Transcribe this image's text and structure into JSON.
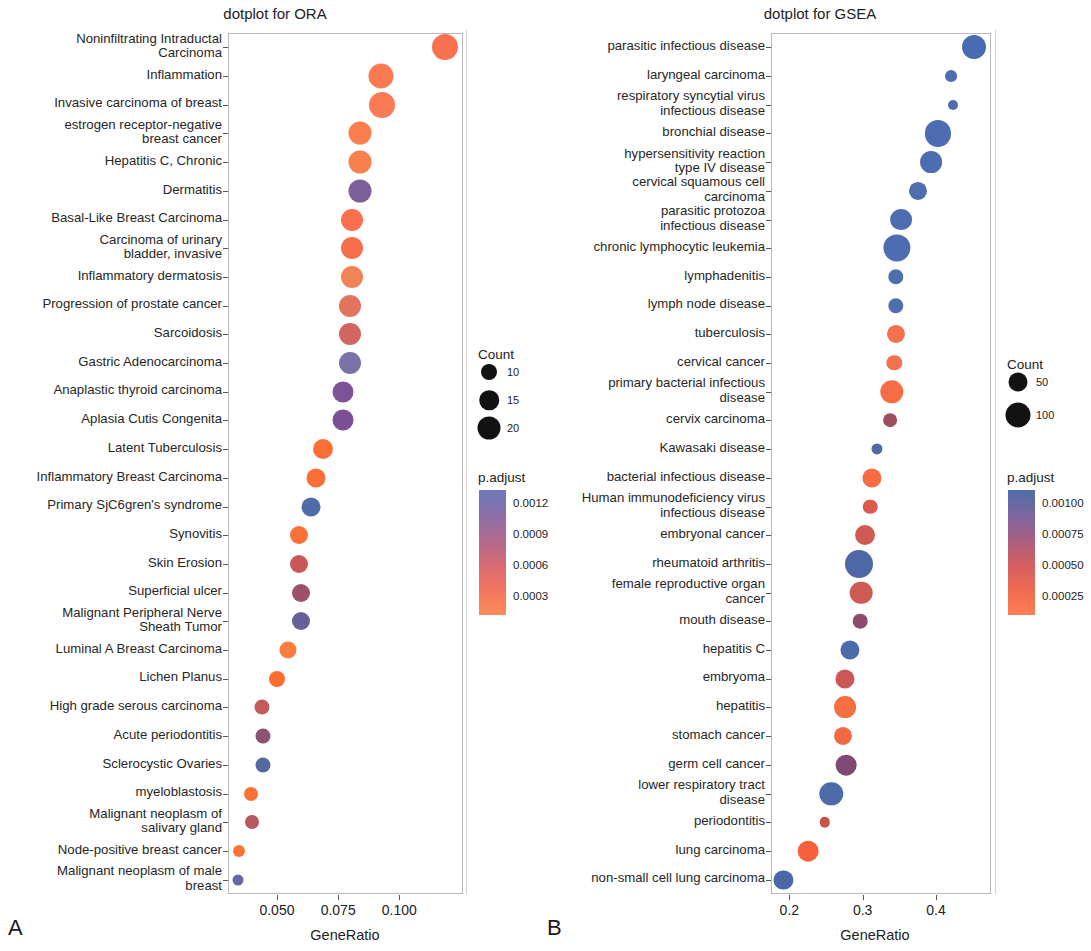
{
  "figure": {
    "panelA_letter": "A",
    "panelB_letter": "B"
  },
  "chart_data": [
    {
      "type": "scatter",
      "id": "ora",
      "title": "dotplot for ORA",
      "xlabel": "GeneRatio",
      "ylabel": "",
      "xlim": [
        0.03,
        0.126
      ],
      "xticks": [
        0.05,
        0.075,
        0.1
      ],
      "xtick_labels": [
        "0.050",
        "0.075",
        "0.100"
      ],
      "grid": false,
      "legend_position": "right",
      "size_legend": {
        "title": "Count",
        "values": [
          10,
          15,
          20
        ],
        "labels": [
          "10",
          "15",
          "20"
        ]
      },
      "color_legend": {
        "title": "p.adjust",
        "ticks": [
          0.0012,
          0.0009,
          0.0006,
          0.0003
        ],
        "tick_labels": [
          "0.0012",
          "0.0009",
          "0.0006",
          "0.0003"
        ],
        "low_color": "#f8766d",
        "high_color": "#5c6bb0",
        "gradient": [
          "#6b79b8",
          "#8c6fa8",
          "#b06a8e",
          "#d76b72",
          "#f4755f",
          "#fb8c5a"
        ]
      },
      "categories": [
        "Noninfiltrating Intraductal\nCarcinoma",
        "Inflammation",
        "Invasive carcinoma of breast",
        "estrogen receptor-negative\nbreast cancer",
        "Hepatitis C, Chronic",
        "Dermatitis",
        "Basal-Like Breast Carcinoma",
        "Carcinoma of urinary\nbladder, invasive",
        "Inflammatory dermatosis",
        "Progression of prostate cancer",
        "Sarcoidosis",
        "Gastric Adenocarcinoma",
        "Anaplastic thyroid carcinoma",
        "Aplasia Cutis Congenita",
        "Latent Tuberculosis",
        "Inflammatory Breast Carcinoma",
        "Primary SjC6gren's syndrome",
        "Synovitis",
        "Skin Erosion",
        "Superficial ulcer",
        "Malignant Peripheral Nerve\nSheath Tumor",
        "Luminal A Breast Carcinoma",
        "Lichen Planus",
        "High grade serous carcinoma",
        "Acute periodontitis",
        "Sclerocystic Ovaries",
        "myeloblastosis",
        "Malignant neoplasm of\nsalivary gland",
        "Node-positive breast cancer",
        "Malignant neoplasm of male\nbreast"
      ],
      "points": [
        {
          "y": "Noninfiltrating Intraductal Carcinoma",
          "x": 0.1185,
          "count": 19,
          "p_adjust": 0.0002,
          "color": "#f8714f"
        },
        {
          "y": "Inflammation",
          "x": 0.0925,
          "count": 18,
          "p_adjust": 0.00022,
          "color": "#fa7a53"
        },
        {
          "y": "Invasive carcinoma of breast",
          "x": 0.093,
          "count": 19,
          "p_adjust": 0.00024,
          "color": "#f97a54"
        },
        {
          "y": "estrogen receptor-negative breast cancer",
          "x": 0.084,
          "count": 16,
          "p_adjust": 0.00022,
          "color": "#fb7e4e"
        },
        {
          "y": "Hepatitis C, Chronic",
          "x": 0.084,
          "count": 16,
          "p_adjust": 0.00026,
          "color": "#f6814f"
        },
        {
          "y": "Dermatitis",
          "x": 0.084,
          "count": 16,
          "p_adjust": 0.001,
          "color": "#7c5f9a"
        },
        {
          "y": "Basal-Like Breast Carcinoma",
          "x": 0.0805,
          "count": 15,
          "p_adjust": 0.00022,
          "color": "#fa6f4c"
        },
        {
          "y": "Carcinoma of urinary bladder, invasive",
          "x": 0.0805,
          "count": 15,
          "p_adjust": 0.00023,
          "color": "#f86e4c"
        },
        {
          "y": "Inflammatory dermatosis",
          "x": 0.0805,
          "count": 15,
          "p_adjust": 0.0003,
          "color": "#f08457"
        },
        {
          "y": "Progression of prostate cancer",
          "x": 0.08,
          "count": 15,
          "p_adjust": 0.00038,
          "color": "#e2735d"
        },
        {
          "y": "Sarcoidosis",
          "x": 0.08,
          "count": 15,
          "p_adjust": 0.00048,
          "color": "#d26660"
        },
        {
          "y": "Gastric Adenocarcinoma",
          "x": 0.08,
          "count": 15,
          "p_adjust": 0.00105,
          "color": "#7b72a8"
        },
        {
          "y": "Anaplastic thyroid carcinoma",
          "x": 0.077,
          "count": 14,
          "p_adjust": 0.00098,
          "color": "#7e529b"
        },
        {
          "y": "Aplasia Cutis Congenita",
          "x": 0.077,
          "count": 14,
          "p_adjust": 0.00097,
          "color": "#7a4f96"
        },
        {
          "y": "Latent Tuberculosis",
          "x": 0.069,
          "count": 13,
          "p_adjust": 0.00018,
          "color": "#fc6e35"
        },
        {
          "y": "Inflammatory Breast Carcinoma",
          "x": 0.066,
          "count": 12,
          "p_adjust": 0.00019,
          "color": "#fb6e36"
        },
        {
          "y": "Primary SjC6gren's syndrome",
          "x": 0.064,
          "count": 12,
          "p_adjust": 0.00116,
          "color": "#4f6ca8"
        },
        {
          "y": "Synovitis",
          "x": 0.059,
          "count": 11,
          "p_adjust": 0.0002,
          "color": "#fb7034"
        },
        {
          "y": "Skin Erosion",
          "x": 0.059,
          "count": 11,
          "p_adjust": 0.00047,
          "color": "#c95757"
        },
        {
          "y": "Superficial ulcer",
          "x": 0.06,
          "count": 11,
          "p_adjust": 0.00059,
          "color": "#9c5069"
        },
        {
          "y": "Malignant Peripheral Nerve Sheath Tumor",
          "x": 0.06,
          "count": 11,
          "p_adjust": 0.00112,
          "color": "#65609c"
        },
        {
          "y": "Luminal A Breast Carcinoma",
          "x": 0.0545,
          "count": 10,
          "p_adjust": 0.0002,
          "color": "#fb7c3c"
        },
        {
          "y": "Lichen Planus",
          "x": 0.05,
          "count": 9,
          "p_adjust": 0.00018,
          "color": "#fc6e2f"
        },
        {
          "y": "High grade serous carcinoma",
          "x": 0.044,
          "count": 8,
          "p_adjust": 0.00046,
          "color": "#c35a5c"
        },
        {
          "y": "Acute periodontitis",
          "x": 0.0445,
          "count": 8,
          "p_adjust": 0.00065,
          "color": "#8f5170"
        },
        {
          "y": "Sclerocystic Ovaries",
          "x": 0.0445,
          "count": 8,
          "p_adjust": 0.00114,
          "color": "#53699f"
        },
        {
          "y": "myeloblastosis",
          "x": 0.0395,
          "count": 7,
          "p_adjust": 0.00019,
          "color": "#fb7235"
        },
        {
          "y": "Malignant neoplasm of salivary gland",
          "x": 0.04,
          "count": 7,
          "p_adjust": 0.00049,
          "color": "#b7575f"
        },
        {
          "y": "Node-positive breast cancer",
          "x": 0.0345,
          "count": 5,
          "p_adjust": 0.0002,
          "color": "#fb7338"
        },
        {
          "y": "Malignant neoplasm of male breast",
          "x": 0.034,
          "count": 4,
          "p_adjust": 0.00115,
          "color": "#6566a6"
        }
      ]
    },
    {
      "type": "scatter",
      "id": "gsea",
      "title": "dotplot for GSEA",
      "xlabel": "GeneRatio",
      "ylabel": "",
      "xlim": [
        0.175,
        0.475
      ],
      "xticks": [
        0.2,
        0.3,
        0.4
      ],
      "xtick_labels": [
        "0.2",
        "0.3",
        "0.4"
      ],
      "grid": false,
      "legend_position": "right",
      "size_legend": {
        "title": "Count",
        "values": [
          50,
          100
        ],
        "labels": [
          "50",
          "100"
        ]
      },
      "color_legend": {
        "title": "p.adjust",
        "ticks": [
          0.001,
          0.00075,
          0.0005,
          0.00025
        ],
        "tick_labels": [
          "0.00100",
          "0.00075",
          "0.00050",
          "0.00025"
        ],
        "low_color": "#f8766d",
        "high_color": "#5c6bb0",
        "gradient": [
          "#4f6ca8",
          "#7b66a0",
          "#a95f80",
          "#d45f62",
          "#ef6a51",
          "#fb7f55"
        ]
      },
      "categories": [
        "parasitic infectious disease",
        "laryngeal carcinoma",
        "respiratory syncytial virus\ninfectious disease",
        "bronchial disease",
        "hypersensitivity reaction\ntype IV disease",
        "cervical squamous cell\ncarcinoma",
        "parasitic protozoa\ninfectious disease",
        "chronic lymphocytic leukemia",
        "lymphadenitis",
        "lymph node disease",
        "tuberculosis",
        "cervical cancer",
        "primary bacterial infectious\ndisease",
        "cervix carcinoma",
        "Kawasaki disease",
        "bacterial infectious disease",
        "Human immunodeficiency virus\ninfectious disease",
        "embryonal cancer",
        "rheumatoid arthritis",
        "female reproductive organ\ncancer",
        "mouth disease",
        "hepatitis C",
        "embryoma",
        "hepatitis",
        "stomach cancer",
        "germ cell cancer",
        "lower respiratory tract\ndisease",
        "periodontitis",
        "lung carcinoma",
        "non-small cell lung carcinoma"
      ],
      "points": [
        {
          "y": "parasitic infectious disease",
          "x": 0.452,
          "count": 80,
          "p_adjust": 0.00104,
          "color": "#4a6bb2"
        },
        {
          "y": "laryngeal carcinoma",
          "x": 0.42,
          "count": 35,
          "p_adjust": 0.00102,
          "color": "#4f6eb0"
        },
        {
          "y": "respiratory syncytial virus infectious disease",
          "x": 0.423,
          "count": 28,
          "p_adjust": 0.00102,
          "color": "#4f6eb0"
        },
        {
          "y": "bronchial disease",
          "x": 0.403,
          "count": 88,
          "p_adjust": 0.00103,
          "color": "#4d6cb1"
        },
        {
          "y": "hypersensitivity reaction type IV disease",
          "x": 0.393,
          "count": 72,
          "p_adjust": 0.00103,
          "color": "#4d6cb1"
        },
        {
          "y": "cervical squamous cell carcinoma",
          "x": 0.375,
          "count": 58,
          "p_adjust": 0.00102,
          "color": "#4f6eb0"
        },
        {
          "y": "parasitic protozoa infectious disease",
          "x": 0.352,
          "count": 72,
          "p_adjust": 0.00103,
          "color": "#4d6cb1"
        },
        {
          "y": "chronic lymphocytic leukemia",
          "x": 0.347,
          "count": 92,
          "p_adjust": 0.00103,
          "color": "#4d6cb1"
        },
        {
          "y": "lymphadenitis",
          "x": 0.345,
          "count": 48,
          "p_adjust": 0.00102,
          "color": "#4f6eb0"
        },
        {
          "y": "lymph node disease",
          "x": 0.345,
          "count": 48,
          "p_adjust": 0.00102,
          "color": "#4f6eb0"
        },
        {
          "y": "tuberculosis",
          "x": 0.345,
          "count": 58,
          "p_adjust": 0.00022,
          "color": "#f4714d"
        },
        {
          "y": "cervical cancer",
          "x": 0.343,
          "count": 48,
          "p_adjust": 0.00022,
          "color": "#f4714d"
        },
        {
          "y": "primary bacterial infectious disease",
          "x": 0.34,
          "count": 78,
          "p_adjust": 0.00021,
          "color": "#f66d45"
        },
        {
          "y": "cervix carcinoma",
          "x": 0.337,
          "count": 42,
          "p_adjust": 0.00057,
          "color": "#9c4f5e"
        },
        {
          "y": "Kawasaki disease",
          "x": 0.32,
          "count": 32,
          "p_adjust": 0.00098,
          "color": "#4f6aa6"
        },
        {
          "y": "bacterial infectious disease",
          "x": 0.313,
          "count": 62,
          "p_adjust": 0.00021,
          "color": "#f76c42"
        },
        {
          "y": "Human immunodeficiency virus infectious disease",
          "x": 0.31,
          "count": 45,
          "p_adjust": 0.00033,
          "color": "#dc5a4c"
        },
        {
          "y": "embryonal cancer",
          "x": 0.303,
          "count": 65,
          "p_adjust": 0.0004,
          "color": "#d25a54"
        },
        {
          "y": "rheumatoid arthritis",
          "x": 0.295,
          "count": 95,
          "p_adjust": 0.00098,
          "color": "#4d68a4"
        },
        {
          "y": "female reproductive organ cancer",
          "x": 0.298,
          "count": 75,
          "p_adjust": 0.0004,
          "color": "#cf5a55"
        },
        {
          "y": "mouth disease",
          "x": 0.297,
          "count": 45,
          "p_adjust": 0.00064,
          "color": "#8d4a6c"
        },
        {
          "y": "hepatitis C",
          "x": 0.283,
          "count": 62,
          "p_adjust": 0.00101,
          "color": "#4c6bab"
        },
        {
          "y": "embryoma",
          "x": 0.276,
          "count": 62,
          "p_adjust": 0.00042,
          "color": "#cc5757"
        },
        {
          "y": "hepatitis",
          "x": 0.276,
          "count": 72,
          "p_adjust": 0.00023,
          "color": "#f56f43"
        },
        {
          "y": "stomach cancer",
          "x": 0.273,
          "count": 58,
          "p_adjust": 0.00024,
          "color": "#f26a42"
        },
        {
          "y": "germ cell cancer",
          "x": 0.277,
          "count": 68,
          "p_adjust": 0.0007,
          "color": "#7e4a74"
        },
        {
          "y": "lower respiratory tract disease",
          "x": 0.257,
          "count": 78,
          "p_adjust": 0.001,
          "color": "#4d6aa9"
        },
        {
          "y": "periodontitis",
          "x": 0.248,
          "count": 30,
          "p_adjust": 0.00034,
          "color": "#c45548"
        },
        {
          "y": "lung carcinoma",
          "x": 0.226,
          "count": 68,
          "p_adjust": 0.00018,
          "color": "#f7603a"
        },
        {
          "y": "non-small cell lung carcinoma",
          "x": 0.192,
          "count": 62,
          "p_adjust": 0.00098,
          "color": "#4a67a6"
        }
      ]
    }
  ]
}
